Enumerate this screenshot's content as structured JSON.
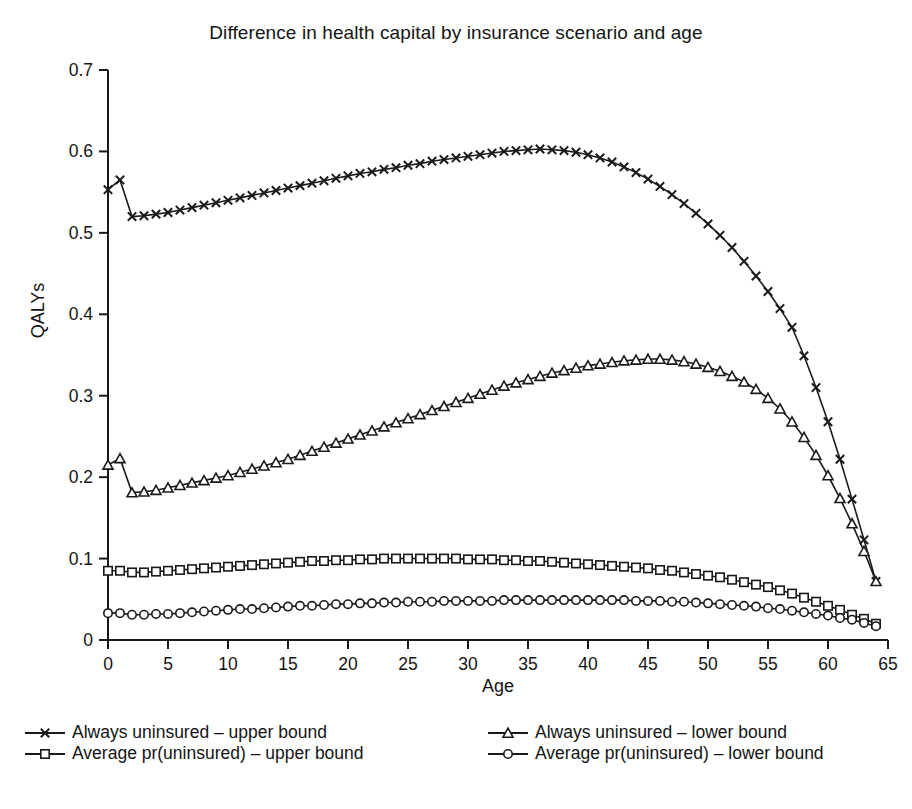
{
  "chart_data": {
    "type": "line",
    "title": "Difference in health capital by insurance scenario and age",
    "xlabel": "Age",
    "ylabel": "QALYs",
    "xlim": [
      0,
      65
    ],
    "ylim": [
      0,
      0.7
    ],
    "xticks": [
      0,
      5,
      10,
      15,
      20,
      25,
      30,
      35,
      40,
      45,
      50,
      55,
      60,
      65
    ],
    "xticklabels": [
      "0",
      "5",
      "10",
      "15",
      "20",
      "25",
      "30",
      "35",
      "40",
      "45",
      "50",
      "55",
      "60",
      "65"
    ],
    "yticks": [
      0,
      0.1,
      0.2,
      0.3,
      0.4,
      0.5,
      0.6,
      0.7
    ],
    "yticklabels": [
      "0",
      "0.1",
      "0.2",
      "0.3",
      "0.4",
      "0.5",
      "0.6",
      "0.7"
    ],
    "grid": false,
    "legend_position": "below",
    "line_color": "#1a1a1a",
    "x": [
      0,
      1,
      2,
      3,
      4,
      5,
      6,
      7,
      8,
      9,
      10,
      11,
      12,
      13,
      14,
      15,
      16,
      17,
      18,
      19,
      20,
      21,
      22,
      23,
      24,
      25,
      26,
      27,
      28,
      29,
      30,
      31,
      32,
      33,
      34,
      35,
      36,
      37,
      38,
      39,
      40,
      41,
      42,
      43,
      44,
      45,
      46,
      47,
      48,
      49,
      50,
      51,
      52,
      53,
      54,
      55,
      56,
      57,
      58,
      59,
      60,
      61,
      62,
      63,
      64
    ],
    "series": [
      {
        "name": "Always uninsured – upper bound",
        "marker": "x-cross",
        "values": [
          0.553,
          0.565,
          0.52,
          0.521,
          0.523,
          0.525,
          0.528,
          0.531,
          0.534,
          0.537,
          0.54,
          0.543,
          0.546,
          0.549,
          0.552,
          0.555,
          0.558,
          0.561,
          0.564,
          0.567,
          0.57,
          0.573,
          0.575,
          0.578,
          0.58,
          0.583,
          0.585,
          0.588,
          0.59,
          0.592,
          0.594,
          0.596,
          0.598,
          0.6,
          0.601,
          0.602,
          0.603,
          0.602,
          0.601,
          0.599,
          0.596,
          0.592,
          0.587,
          0.581,
          0.574,
          0.566,
          0.557,
          0.547,
          0.536,
          0.524,
          0.511,
          0.497,
          0.482,
          0.465,
          0.447,
          0.428,
          0.407,
          0.384,
          0.349,
          0.31,
          0.268,
          0.222,
          0.173,
          0.123,
          0.072
        ]
      },
      {
        "name": "Always uninsured – lower bound",
        "marker": "triangle",
        "values": [
          0.215,
          0.223,
          0.181,
          0.182,
          0.184,
          0.187,
          0.19,
          0.193,
          0.196,
          0.199,
          0.202,
          0.206,
          0.21,
          0.214,
          0.218,
          0.222,
          0.227,
          0.232,
          0.237,
          0.242,
          0.247,
          0.252,
          0.257,
          0.262,
          0.267,
          0.272,
          0.277,
          0.282,
          0.287,
          0.292,
          0.297,
          0.302,
          0.307,
          0.312,
          0.316,
          0.32,
          0.324,
          0.328,
          0.331,
          0.334,
          0.337,
          0.339,
          0.341,
          0.343,
          0.344,
          0.345,
          0.345,
          0.344,
          0.342,
          0.339,
          0.335,
          0.33,
          0.324,
          0.317,
          0.308,
          0.297,
          0.284,
          0.268,
          0.249,
          0.227,
          0.202,
          0.174,
          0.143,
          0.109,
          0.072
        ]
      },
      {
        "name": "Average pr(uninsured) – upper bound",
        "marker": "square",
        "values": [
          0.085,
          0.085,
          0.083,
          0.083,
          0.084,
          0.085,
          0.086,
          0.087,
          0.088,
          0.089,
          0.09,
          0.091,
          0.092,
          0.093,
          0.094,
          0.095,
          0.096,
          0.097,
          0.097,
          0.098,
          0.098,
          0.099,
          0.099,
          0.1,
          0.1,
          0.1,
          0.1,
          0.1,
          0.1,
          0.1,
          0.099,
          0.099,
          0.099,
          0.098,
          0.098,
          0.097,
          0.097,
          0.096,
          0.095,
          0.094,
          0.093,
          0.092,
          0.091,
          0.09,
          0.089,
          0.088,
          0.086,
          0.085,
          0.083,
          0.081,
          0.079,
          0.077,
          0.074,
          0.071,
          0.068,
          0.065,
          0.061,
          0.057,
          0.052,
          0.047,
          0.042,
          0.037,
          0.031,
          0.026,
          0.02
        ]
      },
      {
        "name": "Average pr(uninsured) – lower bound",
        "marker": "circle",
        "values": [
          0.033,
          0.033,
          0.031,
          0.031,
          0.032,
          0.032,
          0.033,
          0.034,
          0.035,
          0.036,
          0.037,
          0.038,
          0.038,
          0.039,
          0.04,
          0.041,
          0.042,
          0.042,
          0.043,
          0.044,
          0.044,
          0.045,
          0.045,
          0.046,
          0.046,
          0.047,
          0.047,
          0.047,
          0.048,
          0.048,
          0.048,
          0.048,
          0.048,
          0.049,
          0.049,
          0.049,
          0.049,
          0.049,
          0.049,
          0.049,
          0.049,
          0.049,
          0.049,
          0.049,
          0.048,
          0.048,
          0.048,
          0.047,
          0.047,
          0.046,
          0.045,
          0.044,
          0.043,
          0.042,
          0.041,
          0.039,
          0.038,
          0.036,
          0.034,
          0.032,
          0.03,
          0.027,
          0.025,
          0.021,
          0.017
        ]
      }
    ]
  },
  "legend": {
    "items": [
      {
        "label": "Always uninsured – upper bound",
        "marker": "x-cross"
      },
      {
        "label": "Always uninsured – lower bound",
        "marker": "triangle"
      },
      {
        "label": "Average pr(uninsured) – upper bound",
        "marker": "square"
      },
      {
        "label": "Average pr(uninsured) – lower bound",
        "marker": "circle"
      }
    ]
  }
}
